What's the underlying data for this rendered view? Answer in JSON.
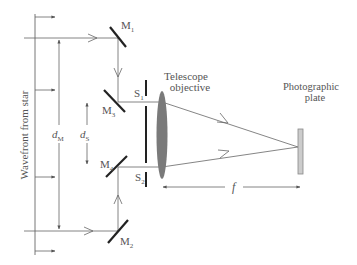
{
  "labels": {
    "wavefront": "Wavefront from star",
    "m1": "M",
    "m1_sub": "1",
    "m2": "M",
    "m2_sub": "2",
    "m3": "M",
    "m3_sub": "3",
    "m4": "M",
    "m4_sub": "4",
    "s1": "S",
    "s1_sub": "1",
    "s2": "S",
    "s2_sub": "2",
    "d_m": "d",
    "d_m_sub": "M",
    "d_s": "d",
    "d_s_sub": "S",
    "telescope_line1": "Telescope",
    "telescope_line2": "objective",
    "plate_line1": "Photographic",
    "plate_line2": "plate",
    "focal_length": "f"
  },
  "colors": {
    "line": "#555555",
    "mirror": "#222222",
    "lens": "#7a7a7a",
    "plate_fill": "#cccccc",
    "plate_stroke": "#888888"
  }
}
